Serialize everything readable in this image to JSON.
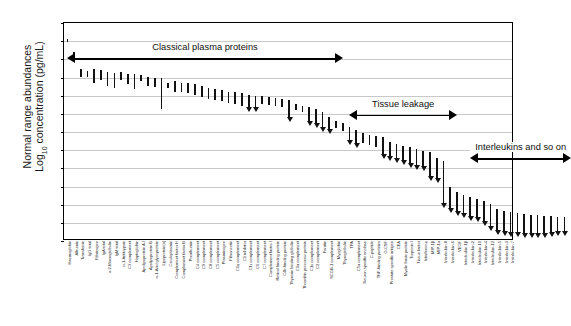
{
  "chart_data": {
    "type": "bar",
    "title": "",
    "xlabel": "",
    "ylabel_line1": "Normal range abundances",
    "ylabel_line2_pre": "Log",
    "ylabel_line2_sub": "10",
    "ylabel_line2_post": " concentration (pg/mL)",
    "ylim": [
      0,
      12
    ],
    "yticks": [
      0,
      1,
      2,
      3,
      4,
      5,
      6,
      7,
      8,
      9,
      10,
      11,
      12
    ],
    "grid": true,
    "legend": "none",
    "series_note": "Each item is a vertical normal-range bar (low to high); items marked arrow render as a downward arrowhead at the lower end.",
    "categories": [
      "Haemoglobin",
      "Albumin",
      "Transferrin",
      "IgG total",
      "Fibrinogen",
      "IgA total",
      "α-2-Macroglobulin",
      "IgM total",
      "α-1-Antitrypsin",
      "C3 complement",
      "Haptoglobin",
      "Apolipoprotein A-I",
      "Apolipoprotein B",
      "α-1-Acid glycoprotein",
      "Lipoprotein(a)",
      "Ceruloplasmin",
      "Complement factor H",
      "Complement factor B",
      "Prealbumin",
      "C4 complement",
      "C9 complement",
      "C8 complement",
      "C5 complement",
      "Plasminogen",
      "Fibronectin",
      "C1q complement",
      "C1 inhibitor",
      "C1r complement",
      "C6 complement",
      "C7 complement",
      "Complement factor I",
      "Retinol binding protein",
      "C4b-binding protein",
      "Thyroxin binding globulin",
      "C3a complement",
      "Thrombin precursor protein",
      "C1s complement",
      "C2 complement",
      "Ferritin",
      "SCGB-1 complement",
      "Myoglobin",
      "Thyroglobulin",
      "TPA",
      "C5a complement",
      "Neuron specific enolase",
      "C-peptide",
      "TNF-binding proteins",
      "G-CSF",
      "Prostate specific antigen",
      "CEA",
      "Myelin basic protein",
      "Troponin I",
      "Tissue factor",
      "Interferon-γ",
      "MIP-1β",
      "MIP-1α",
      "Interleukin-8",
      "Interleukin-6",
      "VEGF",
      "Interleukin-1β",
      "Interleukin-2",
      "Interleukin-10",
      "Interleukin-4",
      "Interleukin-12",
      "Interleukin-5",
      "Interleukin-3",
      "Interleukin-7"
    ],
    "ranges": [
      {
        "low": 10.85,
        "high": 11.1,
        "arrow": false
      },
      {
        "low": 10.15,
        "high": 10.45,
        "arrow": false
      },
      {
        "low": 9.05,
        "high": 9.45,
        "arrow": false
      },
      {
        "low": 9.0,
        "high": 9.38,
        "arrow": false
      },
      {
        "low": 8.7,
        "high": 9.45,
        "arrow": false
      },
      {
        "low": 8.85,
        "high": 9.42,
        "arrow": false
      },
      {
        "low": 8.55,
        "high": 9.3,
        "arrow": false
      },
      {
        "low": 8.4,
        "high": 9.25,
        "arrow": false
      },
      {
        "low": 8.85,
        "high": 9.28,
        "arrow": false
      },
      {
        "low": 8.62,
        "high": 9.2,
        "arrow": false
      },
      {
        "low": 8.35,
        "high": 9.18,
        "arrow": false
      },
      {
        "low": 8.8,
        "high": 9.12,
        "arrow": false
      },
      {
        "low": 8.55,
        "high": 9.05,
        "arrow": false
      },
      {
        "low": 8.45,
        "high": 9.0,
        "arrow": false
      },
      {
        "low": 7.25,
        "high": 9.0,
        "arrow": false
      },
      {
        "low": 8.42,
        "high": 8.7,
        "arrow": false
      },
      {
        "low": 8.2,
        "high": 8.78,
        "arrow": false
      },
      {
        "low": 8.18,
        "high": 8.72,
        "arrow": false
      },
      {
        "low": 8.12,
        "high": 8.68,
        "arrow": false
      },
      {
        "low": 8.05,
        "high": 8.62,
        "arrow": false
      },
      {
        "low": 7.95,
        "high": 8.55,
        "arrow": false
      },
      {
        "low": 7.8,
        "high": 8.4,
        "arrow": false
      },
      {
        "low": 7.75,
        "high": 8.35,
        "arrow": false
      },
      {
        "low": 7.7,
        "high": 8.3,
        "arrow": false
      },
      {
        "low": 7.6,
        "high": 8.22,
        "arrow": false
      },
      {
        "low": 7.55,
        "high": 8.18,
        "arrow": false
      },
      {
        "low": 7.45,
        "high": 8.12,
        "arrow": false
      },
      {
        "low": 7.15,
        "high": 8.05,
        "arrow": true
      },
      {
        "low": 7.1,
        "high": 8.0,
        "arrow": true
      },
      {
        "low": 7.55,
        "high": 7.98,
        "arrow": false
      },
      {
        "low": 7.5,
        "high": 7.92,
        "arrow": false
      },
      {
        "low": 7.42,
        "high": 7.88,
        "arrow": false
      },
      {
        "low": 7.38,
        "high": 7.82,
        "arrow": false
      },
      {
        "low": 6.55,
        "high": 7.78,
        "arrow": true
      },
      {
        "low": 7.2,
        "high": 7.55,
        "arrow": false
      },
      {
        "low": 7.1,
        "high": 7.45,
        "arrow": false
      },
      {
        "low": 6.35,
        "high": 7.35,
        "arrow": true
      },
      {
        "low": 6.25,
        "high": 7.25,
        "arrow": true
      },
      {
        "low": 6.0,
        "high": 7.1,
        "arrow": true
      },
      {
        "low": 5.9,
        "high": 6.85,
        "arrow": true
      },
      {
        "low": 6.2,
        "high": 6.6,
        "arrow": false
      },
      {
        "low": 6.05,
        "high": 6.48,
        "arrow": false
      },
      {
        "low": 5.3,
        "high": 6.3,
        "arrow": true
      },
      {
        "low": 5.15,
        "high": 6.1,
        "arrow": true
      },
      {
        "low": 5.4,
        "high": 5.95,
        "arrow": false
      },
      {
        "low": 5.3,
        "high": 5.85,
        "arrow": false
      },
      {
        "low": 5.2,
        "high": 5.78,
        "arrow": false
      },
      {
        "low": 4.55,
        "high": 5.7,
        "arrow": true
      },
      {
        "low": 4.4,
        "high": 5.45,
        "arrow": true
      },
      {
        "low": 4.3,
        "high": 5.35,
        "arrow": true
      },
      {
        "low": 4.2,
        "high": 5.25,
        "arrow": true
      },
      {
        "low": 4.05,
        "high": 5.15,
        "arrow": true
      },
      {
        "low": 3.95,
        "high": 5.05,
        "arrow": true
      },
      {
        "low": 3.85,
        "high": 4.95,
        "arrow": true
      },
      {
        "low": 3.3,
        "high": 4.88,
        "arrow": true
      },
      {
        "low": 3.2,
        "high": 4.55,
        "arrow": true
      },
      {
        "low": 1.85,
        "high": 4.4,
        "arrow": true
      },
      {
        "low": 1.55,
        "high": 2.95,
        "arrow": true
      },
      {
        "low": 1.4,
        "high": 2.7,
        "arrow": true
      },
      {
        "low": 1.3,
        "high": 2.55,
        "arrow": true
      },
      {
        "low": 1.15,
        "high": 2.42,
        "arrow": true
      },
      {
        "low": 1.05,
        "high": 2.3,
        "arrow": true
      },
      {
        "low": 0.85,
        "high": 2.2,
        "arrow": true
      },
      {
        "low": 0.55,
        "high": 2.05,
        "arrow": true
      },
      {
        "low": 0.35,
        "high": 1.75,
        "arrow": true
      },
      {
        "low": 0.3,
        "high": 1.65,
        "arrow": true
      },
      {
        "low": 0.25,
        "high": 1.6,
        "arrow": true
      },
      {
        "low": 0.22,
        "high": 1.55,
        "arrow": true
      },
      {
        "low": 0.2,
        "high": 1.5,
        "arrow": true
      },
      {
        "low": 0.18,
        "high": 1.45,
        "arrow": true
      },
      {
        "low": 0.18,
        "high": 1.42,
        "arrow": true
      },
      {
        "low": 0.2,
        "high": 1.38,
        "arrow": true
      },
      {
        "low": 0.25,
        "high": 1.35,
        "arrow": true
      },
      {
        "low": 0.28,
        "high": 1.32,
        "arrow": true
      },
      {
        "low": 0.3,
        "high": 1.3,
        "arrow": true
      }
    ],
    "annotations": [
      {
        "label": "Classical plasma proteins",
        "start_index": 0,
        "end_index": 41,
        "y": 10.05
      },
      {
        "label": "Tissue leakage",
        "start_index": 42,
        "end_index": 58,
        "y": 6.95
      },
      {
        "label": "Interleukins and so on",
        "start_index": 60,
        "end_index": 75,
        "y": 4.55
      }
    ]
  }
}
